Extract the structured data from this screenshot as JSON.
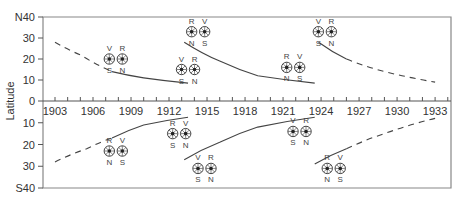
{
  "chart_data": {
    "type": "line",
    "title": "",
    "xlabel": "",
    "ylabel": "Latitude",
    "x_range": [
      1902,
      1935
    ],
    "y_range": [
      -40,
      40
    ],
    "x_ticks": [
      1903,
      1906,
      1909,
      1912,
      1915,
      1918,
      1921,
      1924,
      1927,
      1930,
      1933
    ],
    "y_ticks": [
      {
        "value": 40,
        "label": "N40"
      },
      {
        "value": 30,
        "label": "30"
      },
      {
        "value": 20,
        "label": "20"
      },
      {
        "value": 10,
        "label": "10"
      },
      {
        "value": 0,
        "label": "0"
      },
      {
        "value": -10,
        "label": "10"
      },
      {
        "value": -20,
        "label": "20"
      },
      {
        "value": -30,
        "label": "30"
      },
      {
        "value": -40,
        "label": "S40"
      }
    ],
    "grid": false,
    "series": [
      {
        "name": "north-cycle-1",
        "hemisphere": "N",
        "style": "dashed",
        "points": [
          [
            1903,
            28
          ],
          [
            1905,
            22
          ],
          [
            1907.5,
            14
          ]
        ]
      },
      {
        "name": "north-cycle-1",
        "hemisphere": "N",
        "style": "solid",
        "points": [
          [
            1907.5,
            14
          ],
          [
            1910,
            11
          ],
          [
            1913.5,
            8.5
          ]
        ]
      },
      {
        "name": "north-cycle-2",
        "hemisphere": "N",
        "style": "solid",
        "points": [
          [
            1913.2,
            28
          ],
          [
            1916,
            19
          ],
          [
            1919,
            12
          ],
          [
            1923.5,
            8.5
          ]
        ]
      },
      {
        "name": "north-cycle-3",
        "hemisphere": "N",
        "style": "solid",
        "points": [
          [
            1923.8,
            28
          ],
          [
            1926,
            20
          ]
        ]
      },
      {
        "name": "north-cycle-3",
        "hemisphere": "N",
        "style": "dashed",
        "points": [
          [
            1926,
            20
          ],
          [
            1929,
            14
          ],
          [
            1933,
            9
          ]
        ]
      },
      {
        "name": "south-cycle-1",
        "hemisphere": "S",
        "style": "dashed",
        "points": [
          [
            1903,
            -28
          ],
          [
            1905.5,
            -22
          ],
          [
            1907.5,
            -17
          ]
        ]
      },
      {
        "name": "south-cycle-1",
        "hemisphere": "S",
        "style": "solid",
        "points": [
          [
            1907.5,
            -17
          ],
          [
            1910,
            -11
          ],
          [
            1913.5,
            -7.5
          ]
        ]
      },
      {
        "name": "south-cycle-2",
        "hemisphere": "S",
        "style": "solid",
        "points": [
          [
            1913.2,
            -27
          ],
          [
            1916,
            -19
          ],
          [
            1919,
            -12
          ],
          [
            1923.5,
            -7.5
          ]
        ]
      },
      {
        "name": "south-cycle-3",
        "hemisphere": "S",
        "style": "solid",
        "points": [
          [
            1923.5,
            -29
          ],
          [
            1926,
            -22
          ]
        ]
      },
      {
        "name": "south-cycle-3",
        "hemisphere": "S",
        "style": "dashed",
        "points": [
          [
            1926,
            -22
          ],
          [
            1929,
            -15
          ],
          [
            1933,
            -8
          ]
        ]
      }
    ],
    "annotations": [
      {
        "year": 1907.8,
        "lat": 20,
        "left": {
          "top": "V",
          "bottom": "S"
        },
        "right": {
          "top": "R",
          "bottom": "N"
        }
      },
      {
        "year": 1913.5,
        "lat": 15,
        "left": {
          "top": "V",
          "bottom": "S"
        },
        "right": {
          "top": "R",
          "bottom": "N"
        }
      },
      {
        "year": 1914.3,
        "lat": 33,
        "left": {
          "top": "R",
          "bottom": "N"
        },
        "right": {
          "top": "V",
          "bottom": "S"
        }
      },
      {
        "year": 1921.8,
        "lat": 16,
        "left": {
          "top": "R",
          "bottom": "N"
        },
        "right": {
          "top": "V",
          "bottom": "S"
        }
      },
      {
        "year": 1924.3,
        "lat": 33,
        "left": {
          "top": "V",
          "bottom": "S"
        },
        "right": {
          "top": "R",
          "bottom": "N"
        }
      },
      {
        "year": 1907.8,
        "lat": -23,
        "left": {
          "top": "R",
          "bottom": "N"
        },
        "right": {
          "top": "V",
          "bottom": "S"
        }
      },
      {
        "year": 1912.8,
        "lat": -15,
        "left": {
          "top": "R",
          "bottom": "S"
        },
        "right": {
          "top": "V",
          "bottom": "N"
        }
      },
      {
        "year": 1914.8,
        "lat": -31,
        "left": {
          "top": "V",
          "bottom": "S"
        },
        "right": {
          "top": "R",
          "bottom": "N"
        }
      },
      {
        "year": 1922.3,
        "lat": -14,
        "left": {
          "top": "V",
          "bottom": "S"
        },
        "right": {
          "top": "R",
          "bottom": "N"
        }
      },
      {
        "year": 1925.0,
        "lat": -31,
        "left": {
          "top": "R",
          "bottom": "N"
        },
        "right": {
          "top": "V",
          "bottom": "S"
        }
      }
    ],
    "colors": {
      "line": "#444444",
      "axis": "#555555",
      "frame": "#888888"
    }
  }
}
